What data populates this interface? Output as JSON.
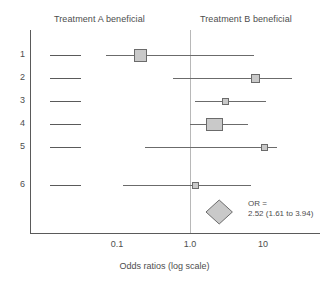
{
  "chart_data": {
    "type": "forest",
    "title": "",
    "xlabel": "Odds ratios (log scale)",
    "ylabel": "",
    "scale": "log",
    "xticks": [
      "0.1",
      "1.0",
      "10"
    ],
    "xtick_values": [
      0.1,
      1.0,
      10
    ],
    "xlim": [
      0.035,
      40
    ],
    "reference_line": 1.0,
    "grid": false,
    "left_header": "Treatment A beneficial",
    "right_header": "Treatment B beneficial",
    "studies": [
      {
        "label": "1",
        "or": 0.21,
        "ci_low": 0.071,
        "ci_high": 7.5,
        "weight": "large"
      },
      {
        "label": "2",
        "or": 7.9,
        "ci_low": 0.59,
        "ci_high": 25.0,
        "weight": "medium"
      },
      {
        "label": "3",
        "or": 3.1,
        "ci_low": 1.17,
        "ci_high": 11.0,
        "weight": "small"
      },
      {
        "label": "4",
        "or": 2.2,
        "ci_low": 1.0,
        "ci_high": 6.3,
        "weight": "xlarge"
      },
      {
        "label": "5",
        "or": 10.5,
        "ci_low": 0.24,
        "ci_high": 15.5,
        "weight": "small"
      },
      {
        "label": "6",
        "or": 1.2,
        "ci_low": 0.12,
        "ci_high": 6.8,
        "weight": "small"
      }
    ],
    "summary": {
      "or": 2.52,
      "ci_low": 1.61,
      "ci_high": 3.94,
      "label_line1": "OR =",
      "label_line2": "2.52 (1.61 to 3.94)"
    },
    "colors": {
      "marker_fill": "#c9c9c9",
      "marker_stroke": "#6b6b6b",
      "axis": "#5a5a5a",
      "reference": "#b8b8b8",
      "text": "#4d4d4d"
    }
  }
}
